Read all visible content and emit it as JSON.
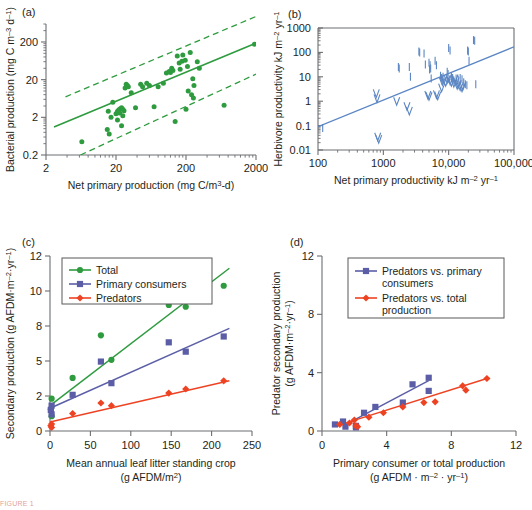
{
  "figure": {
    "caption_fragment": "FIGURE 1",
    "background": "#ffffff"
  },
  "colors": {
    "green": "#2e9b3f",
    "green_dark": "#2e8b38",
    "blue": "#5b86c4",
    "purple": "#5b5ea6",
    "red": "#ee4323",
    "axis": "#6d6e71",
    "text": "#231f20"
  },
  "panels": {
    "a": {
      "letter": "(a)",
      "xlabel": "Net primary production (mg C/m3-d)",
      "ylabel": "Bacterial production (mg C m–3 d–1)",
      "xticks": [
        "2",
        "20",
        "200",
        "2000"
      ],
      "yticks": [
        "200",
        "20",
        "2",
        "0.2"
      ]
    },
    "b": {
      "letter": "(b)",
      "xlabel": "Net primary productivity kJ m–2 yr–1",
      "ylabel": "Herbivore productivity kJ m–2 yr–1",
      "xticks": [
        "100",
        "1000",
        "10,000",
        "100,000"
      ],
      "yticks": [
        "1000",
        "100",
        "10",
        "1",
        "0.1",
        "0.01"
      ]
    },
    "c": {
      "letter": "(c)",
      "xlabel_line1": "Mean annual leaf litter standing crop",
      "xlabel_line2": "(g AFDM/m2)",
      "ylabel": "Secondary production (g AFDM·m–2·yr–1)",
      "xticks": [
        "0",
        "50",
        "100",
        "150",
        "200",
        "250"
      ],
      "yticks": [
        "0",
        "2",
        "5",
        "8",
        "10",
        "12"
      ],
      "legend": [
        {
          "label": "Total",
          "color": "#2e9b3f",
          "marker": "circle"
        },
        {
          "label": "Primary consumers",
          "color": "#5b5ea6",
          "marker": "square"
        },
        {
          "label": "Predators",
          "color": "#ee4323",
          "marker": "diamond"
        }
      ]
    },
    "d": {
      "letter": "(d)",
      "xlabel_line1": "Primary consumer or total production",
      "xlabel_line2": "(g AFDM · m–2 · yr–1)",
      "ylabel_line1": "Predator secondary production",
      "ylabel_line2": "(g AFDM·m–2·yr–1)",
      "xticks": [
        "0",
        "4",
        "8",
        "12"
      ],
      "yticks": [
        "0",
        "4",
        "8",
        "12"
      ],
      "legend": [
        {
          "label_line1": "Predators vs. primary",
          "label_line2": "consumers",
          "color": "#5b5ea6",
          "marker": "square"
        },
        {
          "label_line1": "Predators vs. total",
          "label_line2": "production",
          "color": "#ee4323",
          "marker": "diamond"
        }
      ]
    }
  },
  "chart_data": [
    {
      "id": "a",
      "type": "scatter",
      "title": "(a)",
      "xlabel": "Net primary production (mg C/m3-d)",
      "ylabel": "Bacterial production (mg C m-3 d-1)",
      "xscale": "log",
      "yscale": "log",
      "xlim": [
        2,
        2000
      ],
      "ylim": [
        0.2,
        600
      ],
      "grid": false,
      "legend": "none",
      "marker_color": "#2e9b3f",
      "points": [
        [
          6.5,
          0.45
        ],
        [
          15,
          0.95
        ],
        [
          16,
          0.72
        ],
        [
          15.5,
          2.9
        ],
        [
          17,
          2.0
        ],
        [
          18,
          5.0
        ],
        [
          20,
          2.5
        ],
        [
          21,
          1.7
        ],
        [
          21,
          2.9
        ],
        [
          22,
          3.2
        ],
        [
          22.5,
          2.6
        ],
        [
          23,
          3.4
        ],
        [
          24,
          1.2
        ],
        [
          24,
          3.6
        ],
        [
          25,
          2.2
        ],
        [
          25,
          3.3
        ],
        [
          26,
          3.0
        ],
        [
          27,
          12
        ],
        [
          28,
          15
        ],
        [
          29,
          14
        ],
        [
          30,
          13
        ],
        [
          33,
          9.0
        ],
        [
          38,
          3.6
        ],
        [
          45,
          15
        ],
        [
          48,
          13
        ],
        [
          55,
          16
        ],
        [
          60,
          14
        ],
        [
          70,
          3.8
        ],
        [
          80,
          13
        ],
        [
          95,
          16
        ],
        [
          105,
          30
        ],
        [
          115,
          33
        ],
        [
          120,
          31
        ],
        [
          125,
          40
        ],
        [
          130,
          35
        ],
        [
          140,
          1.55
        ],
        [
          150,
          85
        ],
        [
          160,
          55
        ],
        [
          165,
          38
        ],
        [
          175,
          62
        ],
        [
          180,
          90
        ],
        [
          195,
          65
        ],
        [
          200,
          3.3
        ],
        [
          210,
          45
        ],
        [
          215,
          10
        ],
        [
          230,
          105
        ],
        [
          240,
          8.0
        ],
        [
          250,
          21
        ],
        [
          255,
          6.5
        ],
        [
          260,
          14
        ],
        [
          290,
          60
        ],
        [
          310,
          40
        ],
        [
          700,
          4.2
        ],
        [
          1900,
          175
        ]
      ],
      "fit_line": {
        "x": [
          2.6,
          1900
        ],
        "y": [
          1.1,
          180
        ],
        "style": "solid"
      },
      "confidence_bands": [
        {
          "x": [
            3.8,
            2000
          ],
          "y": [
            7.0,
            950
          ],
          "style": "dashed"
        },
        {
          "x": [
            6.2,
            2000
          ],
          "y": [
            0.2,
            28
          ],
          "style": "dashed"
        }
      ]
    },
    {
      "id": "b",
      "type": "scatter",
      "title": "(b)",
      "xlabel": "Net primary productivity kJ m-2 yr-1",
      "ylabel": "Herbivore productivity kJ m-2 yr-1",
      "xscale": "log",
      "yscale": "log",
      "xlim": [
        100,
        100000
      ],
      "ylim": [
        0.01,
        1000
      ],
      "grid": false,
      "legend": "none",
      "marker_color": "#5b86c4",
      "points_I": [
        [
          118,
          0.08
        ],
        [
          1700,
          25
        ],
        [
          1750,
          22
        ],
        [
          2500,
          25
        ],
        [
          2600,
          10
        ],
        [
          3500,
          110
        ],
        [
          3600,
          100
        ],
        [
          4200,
          90
        ],
        [
          4400,
          32
        ],
        [
          5000,
          38
        ],
        [
          5200,
          30
        ],
        [
          5100,
          20
        ],
        [
          5300,
          22
        ],
        [
          5400,
          8.5
        ],
        [
          6200,
          45
        ],
        [
          6500,
          30
        ],
        [
          7500,
          11
        ],
        [
          7800,
          9
        ],
        [
          8000,
          7
        ],
        [
          8200,
          10
        ],
        [
          9500,
          16
        ],
        [
          9800,
          13
        ],
        [
          10000,
          150
        ],
        [
          10500,
          120
        ],
        [
          11000,
          10
        ],
        [
          11500,
          9
        ],
        [
          12000,
          7
        ],
        [
          13000,
          8.5
        ],
        [
          14000,
          7.5
        ],
        [
          15000,
          9
        ],
        [
          16000,
          8
        ],
        [
          17000,
          6
        ],
        [
          18000,
          5
        ],
        [
          19000,
          4.5
        ],
        [
          19500,
          120
        ],
        [
          20000,
          110
        ],
        [
          20500,
          45
        ],
        [
          24000,
          320
        ],
        [
          25000,
          300
        ],
        [
          26000,
          5
        ]
      ],
      "points_V": [
        [
          780,
          2.1
        ],
        [
          800,
          1.3
        ],
        [
          820,
          0.035
        ],
        [
          850,
          0.028
        ],
        [
          1600,
          1.0
        ],
        [
          2300,
          0.62
        ],
        [
          2500,
          0.4
        ],
        [
          4800,
          1.8
        ],
        [
          5000,
          1.6
        ],
        [
          6500,
          1.9
        ],
        [
          6800,
          1.7
        ],
        [
          7800,
          3.6
        ],
        [
          8000,
          6.5
        ],
        [
          8500,
          7.5
        ],
        [
          9000,
          6.0
        ],
        [
          9500,
          8.0
        ],
        [
          10000,
          9.0
        ],
        [
          10500,
          7.0
        ],
        [
          11000,
          6.0
        ],
        [
          12000,
          5.5
        ],
        [
          12500,
          8.5
        ],
        [
          13000,
          6.5
        ],
        [
          13500,
          4.5
        ],
        [
          14000,
          5.0
        ],
        [
          15000,
          4.0
        ],
        [
          16000,
          3.6
        ],
        [
          16500,
          4.2
        ]
      ],
      "fit_line": {
        "x": [
          100,
          100000
        ],
        "y": [
          0.09,
          170
        ],
        "style": "solid"
      }
    },
    {
      "id": "c",
      "type": "scatter",
      "title": "(c)",
      "xlabel": "Mean annual leaf litter standing crop (g AFDM/m2)",
      "ylabel": "Secondary production (g AFDM m-2 yr-1)",
      "xscale": "linear",
      "yscale": "linear",
      "xlim": [
        0,
        250
      ],
      "ylim": [
        0,
        12
      ],
      "ytick_values": [
        0,
        2,
        5,
        8,
        10,
        12
      ],
      "grid": false,
      "legend": "top-left",
      "series": [
        {
          "name": "Total",
          "color": "#2e9b3f",
          "marker": "circle",
          "points": [
            [
              1,
              1.25
            ],
            [
              2,
              1.85
            ],
            [
              2,
              0.85
            ],
            [
              28,
              3.55
            ],
            [
              63,
              7.2
            ],
            [
              76,
              5.1
            ],
            [
              147,
              9.2
            ],
            [
              168,
              9.1
            ],
            [
              215,
              10.3
            ]
          ],
          "fit_line": {
            "x": [
              0,
              222
            ],
            "y": [
              1.45,
              11.3
            ]
          }
        },
        {
          "name": "Primary consumers",
          "color": "#5b5ea6",
          "marker": "square",
          "points": [
            [
              1,
              1.2
            ],
            [
              2,
              0.95
            ],
            [
              2,
              1.45
            ],
            [
              28,
              2.1
            ],
            [
              63,
              4.95
            ],
            [
              76,
              3.1
            ],
            [
              147,
              6.6
            ],
            [
              168,
              5.8
            ],
            [
              215,
              7.1
            ]
          ],
          "fit_line": {
            "x": [
              0,
              222
            ],
            "y": [
              1.3,
              7.8
            ]
          }
        },
        {
          "name": "Predators",
          "color": "#ee4323",
          "marker": "diamond",
          "points": [
            [
              1,
              0.3
            ],
            [
              2,
              0.4
            ],
            [
              2,
              0.2
            ],
            [
              28,
              1.0
            ],
            [
              63,
              1.6
            ],
            [
              76,
              1.45
            ],
            [
              147,
              2.25
            ],
            [
              168,
              2.6
            ],
            [
              215,
              3.3
            ]
          ],
          "fit_line": {
            "x": [
              0,
              222
            ],
            "y": [
              0.52,
              3.3
            ]
          }
        }
      ]
    },
    {
      "id": "d",
      "type": "scatter",
      "title": "(d)",
      "xlabel": "Primary consumer or total production (g AFDM m-2 yr-1)",
      "ylabel": "Predator secondary production (g AFDM m-2 yr-1)",
      "xscale": "linear",
      "yscale": "linear",
      "xlim": [
        0,
        12
      ],
      "ylim": [
        0,
        12
      ],
      "grid": false,
      "legend": "top-center",
      "series": [
        {
          "name": "Predators vs. primary consumers",
          "color": "#5b5ea6",
          "marker": "square",
          "points": [
            [
              0.8,
              0.45
            ],
            [
              1.3,
              0.65
            ],
            [
              1.45,
              0.3
            ],
            [
              2.1,
              0.35
            ],
            [
              2.1,
              0.25
            ],
            [
              2.6,
              1.25
            ],
            [
              3.3,
              1.65
            ],
            [
              5.0,
              1.95
            ],
            [
              5.6,
              3.2
            ],
            [
              6.6,
              3.65
            ],
            [
              6.6,
              2.75
            ]
          ],
          "fit_line": {
            "x": [
              1.3,
              6.6
            ],
            "y": [
              0.35,
              3.45
            ]
          }
        },
        {
          "name": "Predators vs. total production",
          "color": "#ee4323",
          "marker": "diamond",
          "points": [
            [
              1.1,
              0.45
            ],
            [
              1.7,
              0.55
            ],
            [
              2.0,
              0.75
            ],
            [
              2.1,
              0.35
            ],
            [
              2.2,
              0.3
            ],
            [
              2.9,
              0.95
            ],
            [
              3.8,
              1.25
            ],
            [
              5.0,
              1.65
            ],
            [
              6.3,
              1.95
            ],
            [
              7.0,
              2.0
            ],
            [
              8.7,
              3.1
            ],
            [
              8.9,
              2.8
            ],
            [
              10.2,
              3.6
            ]
          ],
          "fit_line": {
            "x": [
              1.1,
              10.2
            ],
            "y": [
              0.42,
              3.6
            ]
          }
        }
      ]
    }
  ]
}
